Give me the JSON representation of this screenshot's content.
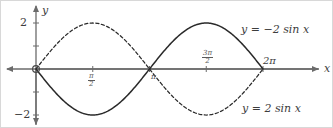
{
  "figure": {
    "kind": "math-graph",
    "width": 333,
    "height": 128,
    "background": "#ffffff",
    "border_color": "#d8d8d8"
  },
  "axes": {
    "x_label": "x",
    "y_label": "y",
    "x_axis_color": "#6b6b6b",
    "y_axis_color": "#6b6b6b",
    "origin_marker": "open-circle",
    "x_range": [
      -0.6,
      7.1
    ],
    "y_range": [
      -2.7,
      2.9
    ],
    "y_ticks": [
      {
        "value": 2,
        "label": "2"
      },
      {
        "value": 1,
        "label": ""
      },
      {
        "value": -1,
        "label": ""
      },
      {
        "value": -2,
        "label": "−2"
      }
    ],
    "x_ticks": [
      {
        "value": 1.5707963,
        "label_num": "π",
        "label_den": "2",
        "label_text": "π/2",
        "position": "below"
      },
      {
        "value": 3.1415927,
        "label_text": "π",
        "position": "below"
      },
      {
        "value": 4.712389,
        "label_num": "3π",
        "label_den": "2",
        "label_text": "3π/2",
        "position": "above"
      },
      {
        "value": 6.2831853,
        "label_text": "2π",
        "position": "above"
      }
    ]
  },
  "annotations": {
    "solid_curve_label": "y = −2 sin x",
    "dashed_curve_label": "y = 2 sin x"
  },
  "chart_data": {
    "type": "line",
    "title": "",
    "xlabel": "x",
    "ylabel": "y",
    "xlim": [
      -0.6,
      7.1
    ],
    "ylim": [
      -2.7,
      2.9
    ],
    "grid": false,
    "legend": "inline-annotations",
    "xticks": [
      1.5707963,
      3.1415927,
      4.712389,
      6.2831853
    ],
    "xticklabels": [
      "π/2",
      "π",
      "3π/2",
      "2π"
    ],
    "yticks": [
      -2,
      -1,
      1,
      2
    ],
    "yticklabels": [
      "−2",
      "",
      "",
      "2"
    ],
    "series": [
      {
        "name": "y = −2 sin x",
        "style": "solid",
        "color": "#2a2a2a",
        "amplitude": -2,
        "period": 6.2831853,
        "domain": [
          0,
          6.2831853
        ],
        "x": [
          0,
          0.3927,
          0.7854,
          1.1781,
          1.5708,
          1.9635,
          2.3562,
          2.7489,
          3.1416,
          3.5343,
          3.927,
          4.3197,
          4.7124,
          5.1051,
          5.4978,
          5.8905,
          6.2832
        ],
        "values": [
          0,
          -0.765,
          -1.414,
          -1.848,
          -2,
          -1.848,
          -1.414,
          -0.765,
          0,
          0.765,
          1.414,
          1.848,
          2,
          1.848,
          1.414,
          0.765,
          0
        ]
      },
      {
        "name": "y = 2 sin x",
        "style": "dashed",
        "color": "#2a2a2a",
        "amplitude": 2,
        "period": 6.2831853,
        "domain": [
          0,
          6.2831853
        ],
        "x": [
          0,
          0.3927,
          0.7854,
          1.1781,
          1.5708,
          1.9635,
          2.3562,
          2.7489,
          3.1416,
          3.5343,
          3.927,
          4.3197,
          4.7124,
          5.1051,
          5.4978,
          5.8905,
          6.2832
        ],
        "values": [
          0,
          0.765,
          1.414,
          1.848,
          2,
          1.848,
          1.414,
          0.765,
          0,
          -0.765,
          -1.414,
          -1.848,
          -2,
          -1.848,
          -1.414,
          -0.765,
          0
        ]
      }
    ]
  }
}
